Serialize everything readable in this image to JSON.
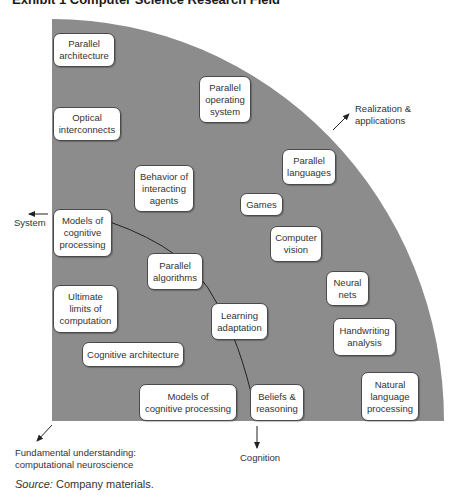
{
  "title": "Exhibit 1   Computer Science Research Field",
  "colors": {
    "quadrant_fill": "#8c8c8c",
    "box_fill": "#ffffff",
    "box_border": "#4a4a4a",
    "text": "#333333"
  },
  "boxes": [
    {
      "id": "parallel-architecture",
      "text": "Parallel\narchitecture"
    },
    {
      "id": "optical-interconnects",
      "text": "Optical\ninterconnects"
    },
    {
      "id": "parallel-operating-system",
      "text": "Parallel\noperating\nsystem"
    },
    {
      "id": "behavior-of-interacting-agents",
      "text": "Behavior of\ninteracting\nagents"
    },
    {
      "id": "parallel-languages",
      "text": "Parallel\nlanguages"
    },
    {
      "id": "games",
      "text": "Games"
    },
    {
      "id": "models-of-cognitive-processing-top",
      "text": "Models of\ncognitive\nprocessing"
    },
    {
      "id": "computer-vision",
      "text": "Computer\nvision"
    },
    {
      "id": "parallel-algorithms",
      "text": "Parallel\nalgorithms"
    },
    {
      "id": "neural-nets",
      "text": "Neural\nnets"
    },
    {
      "id": "ultimate-limits-of-computation",
      "text": "Ultimate\nlimits of\ncomputation"
    },
    {
      "id": "learning-adaptation",
      "text": "Learning\nadaptation"
    },
    {
      "id": "handwriting-analysis",
      "text": "Handwriting\nanalysis"
    },
    {
      "id": "cognitive-architecture",
      "text": "Cognitive architecture"
    },
    {
      "id": "models-of-cognitive-processing-bottom",
      "text": "Models of\ncognitive processing"
    },
    {
      "id": "beliefs-reasoning",
      "text": "Beliefs &\nreasoning"
    },
    {
      "id": "natural-language-processing",
      "text": "Natural\nlanguage\nprocessing"
    }
  ],
  "axes": {
    "realization": "Realization &\napplications",
    "system": "System",
    "cognition": "Cognition",
    "fundamental": "Fundamental understanding:\ncomputational neuroscience"
  },
  "source": {
    "label": "Source:",
    "text": " Company materials."
  }
}
